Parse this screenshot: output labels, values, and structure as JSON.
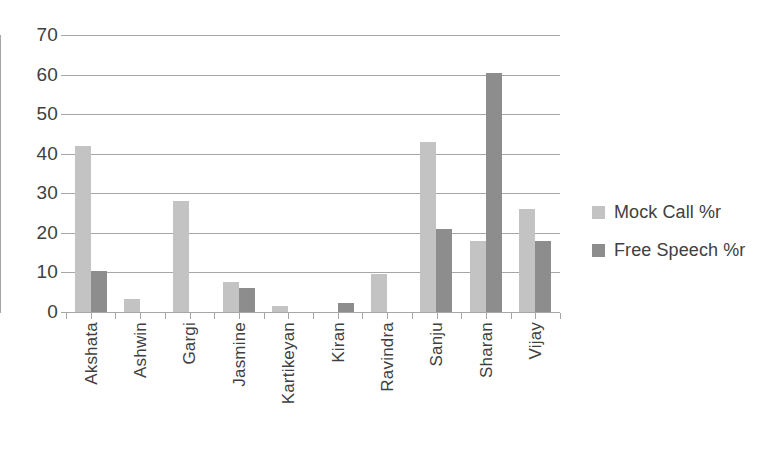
{
  "chart_data": {
    "type": "bar",
    "title": "",
    "subtitle": "",
    "xlabel": "",
    "ylabel": "",
    "categories": [
      "Akshata",
      "Ashwin",
      "Gargi",
      "Jasmine",
      "Kartikeyan",
      "Kiran",
      "Ravindra",
      "Sanju",
      "Sharan",
      "Vijay"
    ],
    "series": [
      {
        "name": "Mock Call %r",
        "color": "#c3c3c3",
        "values": [
          42,
          3.3,
          28,
          7.5,
          1.5,
          0,
          9.5,
          43,
          18,
          26
        ]
      },
      {
        "name": "Free Speech %r",
        "color": "#8d8d8d",
        "values": [
          10.3,
          0,
          0,
          6,
          0,
          2.2,
          0,
          21,
          60.5,
          18
        ]
      }
    ],
    "ylim": [
      0,
      70
    ],
    "yticks": [
      0,
      10,
      20,
      30,
      40,
      50,
      60,
      70
    ],
    "ytick_labels": [
      "0",
      "10",
      "20",
      "30",
      "40",
      "50",
      "60",
      "70"
    ],
    "grid": true,
    "grid_axis": "y",
    "legend_position": "right",
    "axis_color": "#a6a6a6",
    "text_color": "#404040",
    "background": "#ffffff"
  }
}
